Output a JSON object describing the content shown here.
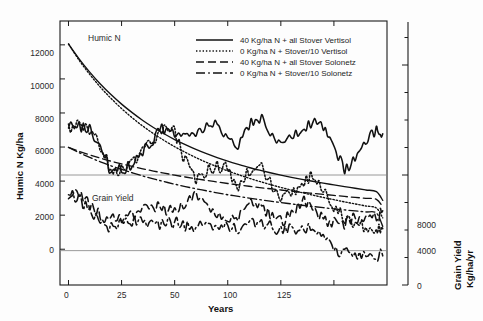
{
  "figure": {
    "width": 483,
    "height": 321,
    "background": "#fdfdfd",
    "line_color": "#111111",
    "reference_line_color": "#8d8d8d",
    "frame_color": "#1a1a1a"
  },
  "annotations": {
    "humic_n": "Humic N",
    "grain_yield": "Grain Yield"
  },
  "axes": {
    "x": {
      "label": "Years",
      "ticks": [
        0,
        25,
        50,
        75,
        100,
        125
      ],
      "tick_labels": [
        "0",
        "25",
        "50",
        "75",
        "100",
        "125"
      ],
      "labeled": [
        true,
        true,
        true,
        false,
        true,
        true
      ],
      "min": -4,
      "max": 150
    },
    "y_left": {
      "label_line1": "Humic N Kg/ha",
      "ticks": [
        0,
        2000,
        4000,
        6000,
        8000,
        10000,
        12000
      ],
      "tick_labels": [
        "0",
        "2000",
        "4000",
        "6000",
        "8000",
        "10000",
        "12000"
      ],
      "min": -2100,
      "max": 13400
    },
    "y_right": {
      "label_line1": "Grain  Yield",
      "label_line2": "Kg/ha/yr",
      "ticks": [
        0,
        1000,
        2000,
        3000,
        4000,
        5000,
        6000,
        7000,
        8000,
        9000
      ],
      "major_ticks": [
        0,
        4000,
        8000
      ],
      "tick_labels": [
        "0",
        "4000",
        "8000"
      ],
      "min": 0,
      "max": 9600
    }
  },
  "legend": {
    "entries": [
      {
        "label": "40 Kg/ha N + all Stover Vertisol",
        "style": "solid",
        "series": "vertisol_40n"
      },
      {
        "label": "0 Kg/ha N + Stover/10  Vertisol",
        "style": "dotted",
        "series": "vertisol_0n"
      },
      {
        "label": "40 Kg/ha N + all Stover Solonetz",
        "style": "dashed",
        "series": "solonetz_40n"
      },
      {
        "label": "0 Kg/ha N + Stover/10  Solonetz",
        "style": "dashdot",
        "series": "solonetz_0n"
      }
    ]
  },
  "chart_data": {
    "type": "line",
    "title": "",
    "xlabel": "Years",
    "ylabel": "Humic N Kg/ha",
    "ylabel_right": "Grain Yield Kg/ha/yr",
    "xlim": [
      -4,
      150
    ],
    "ylim": [
      -2100,
      13400
    ],
    "ylim_right": [
      0,
      9600
    ],
    "grid": false,
    "legend_position": "top-center",
    "x": [
      0,
      5,
      10,
      15,
      20,
      25,
      30,
      35,
      40,
      45,
      50,
      55,
      60,
      65,
      70,
      75,
      80,
      85,
      90,
      95,
      100,
      105,
      110,
      115,
      120,
      125,
      130,
      135,
      140,
      145,
      148
    ],
    "series": [
      {
        "name": "40 Kg/ha N + all Stover Vertisol",
        "panel": "humic_n",
        "style": "solid",
        "axis": "left",
        "values": [
          12050,
          11180,
          10400,
          9700,
          9080,
          8520,
          8020,
          7560,
          7150,
          6780,
          6440,
          6140,
          5860,
          5610,
          5380,
          5170,
          4980,
          4800,
          4640,
          4490,
          4350,
          4220,
          4100,
          3990,
          3880,
          3780,
          3680,
          3580,
          3480,
          3380,
          2870
        ]
      },
      {
        "name": "0 Kg/ha N + Stover/10  Vertisol",
        "panel": "humic_n",
        "style": "dotted",
        "axis": "left",
        "values": [
          12050,
          11100,
          10270,
          9520,
          8860,
          8260,
          7720,
          7230,
          6790,
          6390,
          6020,
          5690,
          5380,
          5100,
          4840,
          4600,
          4380,
          4170,
          3980,
          3800,
          3630,
          3470,
          3320,
          3180,
          3040,
          2910,
          2780,
          2660,
          2540,
          2420,
          1840
        ]
      },
      {
        "name": "40 Kg/ha N + all Stover Solonetz",
        "panel": "humic_n",
        "style": "dashed",
        "axis": "left",
        "values": [
          5980,
          5750,
          5540,
          5350,
          5170,
          5010,
          4860,
          4720,
          4590,
          4470,
          4350,
          4240,
          4140,
          4040,
          3950,
          3860,
          3780,
          3700,
          3620,
          3550,
          3480,
          3410,
          3340,
          3280,
          3220,
          3160,
          3100,
          3040,
          2990,
          2930,
          2500
        ]
      },
      {
        "name": "0 Kg/ha N + Stover/10  Solonetz",
        "panel": "humic_n",
        "style": "dashdot",
        "axis": "left",
        "values": [
          5980,
          5670,
          5390,
          5130,
          4900,
          4690,
          4490,
          4300,
          4130,
          3970,
          3820,
          3680,
          3550,
          3430,
          3310,
          3200,
          3100,
          3000,
          2910,
          2820,
          2740,
          2660,
          2580,
          2510,
          2440,
          2370,
          2310,
          2250,
          2190,
          2130,
          1340
        ]
      },
      {
        "name": "40 Kg/ha N + all Stover Vertisol",
        "panel": "grain_yield",
        "style": "solid",
        "axis": "right",
        "values": [
          5680,
          5820,
          5640,
          5020,
          4180,
          4180,
          4400,
          4900,
          5300,
          5720,
          5600,
          5420,
          5500,
          5900,
          5780,
          5400,
          5100,
          5780,
          6100,
          5600,
          5180,
          5420,
          5600,
          5980,
          5800,
          5020,
          4200,
          4500,
          5100,
          5640,
          5500
        ]
      },
      {
        "name": "0 Kg/ha N + Stover/10  Vertisol",
        "panel": "grain_yield",
        "style": "dotted",
        "axis": "right",
        "values": [
          5680,
          5800,
          5620,
          5000,
          4160,
          4160,
          4380,
          4880,
          5280,
          5700,
          5560,
          4500,
          3900,
          4120,
          4300,
          4250,
          3600,
          4120,
          4400,
          3700,
          3250,
          3400,
          3680,
          3980,
          3600,
          2900,
          2400,
          2250,
          2150,
          2100,
          2050
        ]
      },
      {
        "name": "40 Kg/ha N + all Stover Solonetz",
        "panel": "grain_yield",
        "style": "dashed",
        "axis": "right",
        "values": [
          3280,
          3200,
          2900,
          2500,
          2350,
          2460,
          2520,
          2920,
          2860,
          2760,
          2800,
          2950,
          3400,
          2980,
          2450,
          2380,
          2500,
          3100,
          2950,
          2520,
          2300,
          2600,
          3050,
          2880,
          2400,
          2250,
          2200,
          2420,
          2560,
          2400,
          2700
        ]
      },
      {
        "name": "0 Kg/ha N + Stover/10  Solonetz",
        "panel": "grain_yield",
        "style": "dashdot",
        "axis": "right",
        "values": [
          3280,
          3100,
          2720,
          2180,
          2050,
          2180,
          2260,
          2400,
          2250,
          2200,
          2280,
          2160,
          2100,
          2150,
          2200,
          2180,
          2050,
          2300,
          2280,
          2100,
          1980,
          2000,
          2050,
          2000,
          1650,
          1350,
          1200,
          1150,
          1120,
          1080,
          1060
        ]
      }
    ],
    "reference_lines": [
      {
        "axis": "right",
        "value": 4000
      },
      {
        "axis": "right",
        "value": 1250
      }
    ]
  }
}
